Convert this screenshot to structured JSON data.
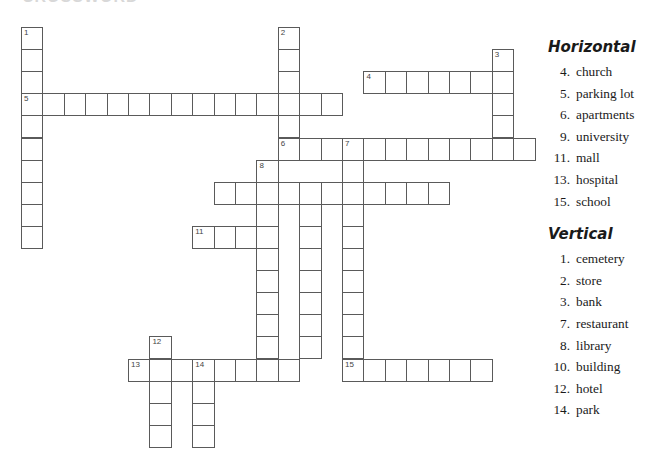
{
  "title": "CROSSWORD",
  "grid": {
    "origin_x": 21,
    "origin_y": 27,
    "col_pitch": 21.4,
    "row_pitch": 22.1,
    "entries": [
      {
        "number": "1",
        "dir": "down",
        "row": 0,
        "col": 0,
        "length": 10
      },
      {
        "number": "2",
        "dir": "down",
        "row": 0,
        "col": 12,
        "length": 6
      },
      {
        "number": "3",
        "dir": "down",
        "row": 1,
        "col": 22,
        "length": 5
      },
      {
        "number": "4",
        "dir": "across",
        "row": 2,
        "col": 16,
        "length": 7
      },
      {
        "number": "5",
        "dir": "across",
        "row": 3,
        "col": 0,
        "length": 15
      },
      {
        "number": "6",
        "dir": "across",
        "row": 5,
        "col": 12,
        "length": 12
      },
      {
        "number": "7",
        "dir": "down",
        "row": 5,
        "col": 15,
        "length": 11
      },
      {
        "number": "8",
        "dir": "down",
        "row": 6,
        "col": 11,
        "length": 10
      },
      {
        "number": "",
        "dir": "across",
        "row": 7,
        "col": 9,
        "length": 11
      },
      {
        "number": "",
        "dir": "down",
        "row": 7,
        "col": 13,
        "length": 8
      },
      {
        "number": "11",
        "dir": "across",
        "row": 9,
        "col": 8,
        "length": 4
      },
      {
        "number": "12",
        "dir": "down",
        "row": 14,
        "col": 6,
        "length": 5
      },
      {
        "number": "13",
        "dir": "across",
        "row": 15,
        "col": 5,
        "length": 8
      },
      {
        "number": "14",
        "dir": "down",
        "row": 15,
        "col": 8,
        "length": 4
      },
      {
        "number": "15",
        "dir": "across",
        "row": 15,
        "col": 15,
        "length": 7
      }
    ]
  },
  "clues": {
    "horizontal": {
      "heading": "Horizontal",
      "items": [
        {
          "n": "4.",
          "text": "church"
        },
        {
          "n": "5.",
          "text": "parking lot"
        },
        {
          "n": "6.",
          "text": "apartments"
        },
        {
          "n": "9.",
          "text": "university"
        },
        {
          "n": "11.",
          "text": "mall"
        },
        {
          "n": "13.",
          "text": "hospital"
        },
        {
          "n": "15.",
          "text": "school"
        }
      ]
    },
    "vertical": {
      "heading": "Vertical",
      "items": [
        {
          "n": "1.",
          "text": "cemetery"
        },
        {
          "n": "2.",
          "text": "store"
        },
        {
          "n": "3.",
          "text": "bank"
        },
        {
          "n": "7.",
          "text": "restaurant"
        },
        {
          "n": "8.",
          "text": "library"
        },
        {
          "n": "10.",
          "text": "building"
        },
        {
          "n": "12.",
          "text": "hotel"
        },
        {
          "n": "14.",
          "text": "park"
        }
      ]
    }
  }
}
